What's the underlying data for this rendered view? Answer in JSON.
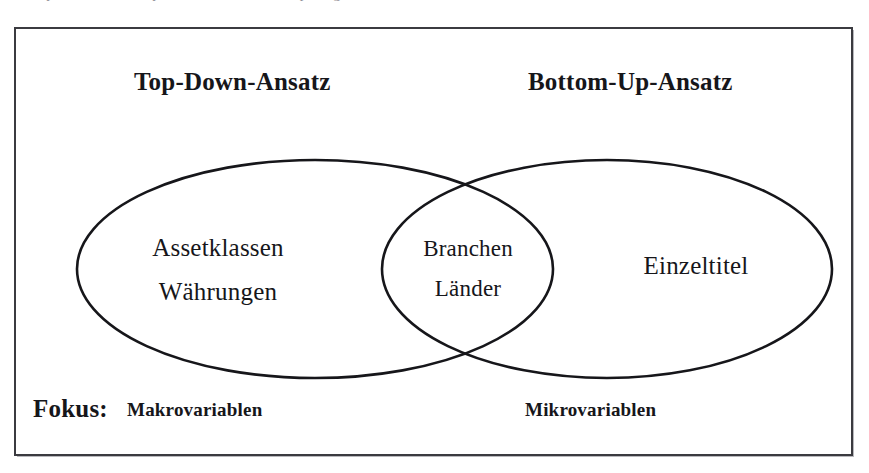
{
  "page": {
    "background_color": "#ffffff",
    "ink_color": "#16161a",
    "frame_border_color": "#3b3b40"
  },
  "scan_artifact": {
    "clipped_caption_text": "Beispiel  fur  einen Top-Down und Bottom-Up  Vergleich"
  },
  "headings": {
    "left": "Top-Down-Ansatz",
    "right": "Bottom-Up-Ansatz"
  },
  "diagram": {
    "type": "venn",
    "left_set": {
      "name": "Top-Down-Ansatz",
      "items": [
        "Assetklassen",
        "Währungen"
      ]
    },
    "intersection": {
      "name": "Überschneidung",
      "items": [
        "Branchen",
        "Länder"
      ]
    },
    "right_set": {
      "name": "Bottom-Up-Ansatz",
      "items": [
        "Einzeltitel"
      ]
    }
  },
  "focus_row": {
    "label": "Fokus:",
    "left_value": "Makrovariablen",
    "right_value": "Mikrovariablen"
  }
}
